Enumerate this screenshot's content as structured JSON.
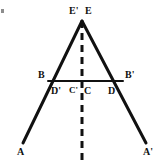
{
  "figure": {
    "kind": "geometry-diagram",
    "background_color": "#ffffff",
    "line_color": "#111111",
    "label_color": "#111111",
    "width": 166,
    "height": 163
  },
  "labels": [
    {
      "id": "E-prime",
      "text": "E'",
      "x": 69,
      "y": 6,
      "size": 10
    },
    {
      "id": "E",
      "text": "E",
      "x": 85,
      "y": 6,
      "size": 10
    },
    {
      "id": "B",
      "text": "B",
      "x": 38,
      "y": 70,
      "size": 10
    },
    {
      "id": "B-prime",
      "text": "B'",
      "x": 125,
      "y": 70,
      "size": 10
    },
    {
      "id": "D-prime",
      "text": "D'",
      "x": 51,
      "y": 86,
      "size": 10
    },
    {
      "id": "C-prime",
      "text": "C'",
      "x": 69,
      "y": 86,
      "size": 9
    },
    {
      "id": "C",
      "text": "C",
      "x": 84,
      "y": 86,
      "size": 10
    },
    {
      "id": "D",
      "text": "D",
      "x": 108,
      "y": 86,
      "size": 10
    },
    {
      "id": "A",
      "text": "A",
      "x": 17,
      "y": 147,
      "size": 10
    },
    {
      "id": "A-prime",
      "text": "A'",
      "x": 143,
      "y": 147,
      "size": 10
    }
  ],
  "points": {
    "apex": {
      "name": "E",
      "x": 82,
      "y": 21
    },
    "B": {
      "name": "B",
      "x": 48,
      "y": 81
    },
    "B_prime": {
      "name": "B'",
      "x": 123,
      "y": 81
    },
    "C": {
      "name": "C",
      "x": 82,
      "y": 81
    },
    "A": {
      "name": "A",
      "x": 23,
      "y": 143
    },
    "A_prime": {
      "name": "A'",
      "x": 146,
      "y": 143
    }
  },
  "solid_lines": [
    {
      "id": "left-ray-EA",
      "from": "E",
      "to": "A",
      "x1": 82,
      "y1": 21,
      "x2": 23,
      "y2": 143,
      "width": 3
    },
    {
      "id": "right-ray-EAprime",
      "from": "E",
      "to": "A'",
      "x1": 82,
      "y1": 21,
      "x2": 146,
      "y2": 143,
      "width": 3
    },
    {
      "id": "chord-BBprime",
      "from": "B",
      "to": "B'",
      "x1": 48,
      "y1": 81,
      "x2": 123,
      "y2": 81,
      "width": 2
    }
  ],
  "dashed_lines": [
    {
      "id": "axis-of-symmetry",
      "x1": 82,
      "y1": 21,
      "x2": 82,
      "y2": 161,
      "width": 3,
      "dash": "7 5"
    }
  ],
  "artifacts": [
    {
      "id": "scan-speck-top-left",
      "x": 1,
      "y": 9,
      "w": 3,
      "h": 4,
      "color": "#8d8d8d"
    }
  ]
}
